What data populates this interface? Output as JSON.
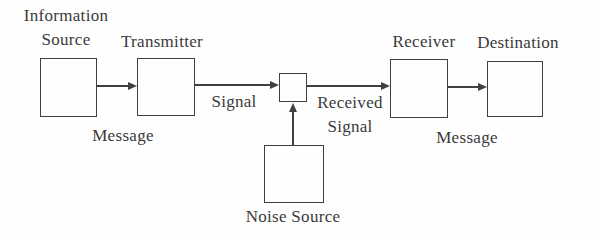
{
  "diagram": {
    "nodes": {
      "information_source": {
        "line1": "Information",
        "line2": "Source"
      },
      "transmitter": {
        "label": "Transmitter"
      },
      "receiver": {
        "label": "Receiver"
      },
      "destination": {
        "label": "Destination"
      },
      "noise_source": {
        "label": "Noise Source"
      }
    },
    "edge_labels": {
      "message_left": "Message",
      "signal": "Signal",
      "received_signal_line1": "Received",
      "received_signal_line2": "Signal",
      "message_right": "Message"
    },
    "colors": {
      "line": "#404040",
      "text": "#3a3a3a",
      "background": "#fefefe"
    }
  }
}
